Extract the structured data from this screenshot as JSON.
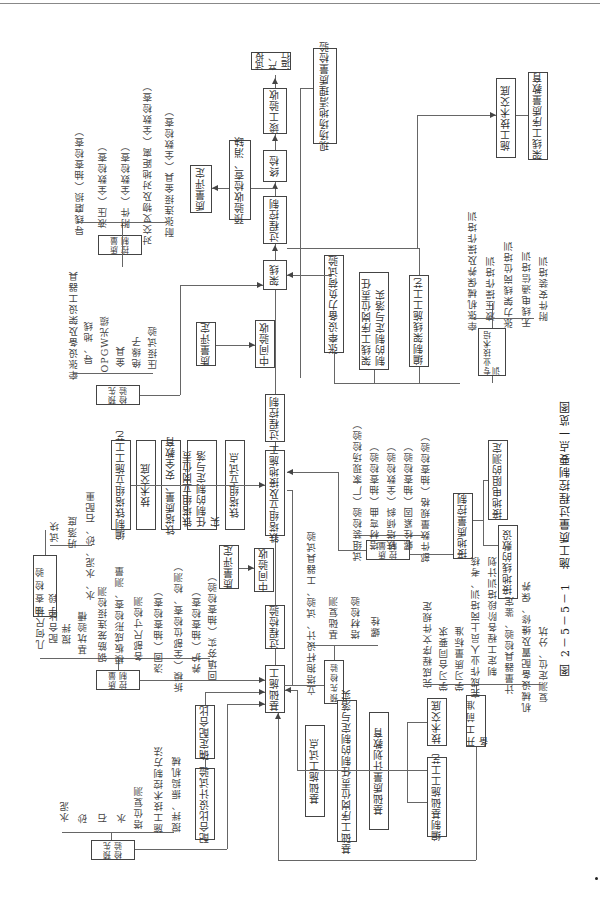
{
  "caption": "图 2－5－5－1　施工质量过程控制要点一览图",
  "main_flow": {
    "foundation": "基础施工",
    "process_inspection": "过程检验",
    "interim_acceptance_1": "中间验收",
    "tower_erection": "铁塔组立及接地施工",
    "process_control_1": "过程控制",
    "interim_acceptance_2": "中间验收",
    "stringing": "架线",
    "process_control_2": "过程控制",
    "final_inspection": "终检",
    "completion_acceptance": "竣工验收",
    "trial_operation": "试投产、运行"
  },
  "quality_rating": [
    "质量评定",
    "质量评定",
    "质量评定"
  ],
  "pre_acceptance": "预验收检查、消缺",
  "site_cleanup": "现场场地清理质量检验",
  "stringing_qc": {
    "title": "质量控制",
    "items": [
      "导线磨损（抽查检查）",
      "液压（全数检查）",
      "附件（全数检查）",
      "对交叉物及对地距离（全数检查）",
      "耐张连接金具（全数检查）"
    ]
  },
  "stringing_precheck": {
    "title": "预先检验",
    "items": [
      "牵张设备及架设工器具",
      "导、地线",
      "OPGW光缆",
      "金具",
      "绝缘子",
      "压接试验"
    ]
  },
  "stringing_prep": {
    "load_test": "张牵设备力负荷试验",
    "responsibility": "架线工序岗位责任制的制定与落实",
    "process": "编制架线施工工艺",
    "tech_briefing": "施工技术交底",
    "quality_education": "架线工序质量教育"
  },
  "training": {
    "title": "专业技术培训",
    "items": [
      "牵张机械保养及操作培训",
      "液压操作培训",
      "张力架线岗位培训",
      "无线电通信培训",
      "附件安装培训"
    ]
  },
  "tower_prep": [
    "编制铁塔组立施工工艺",
    "技术交底",
    "铁塔质量、安全教育",
    "铁塔组立岗位责任制的制定与落实",
    "铁塔组立试点"
  ],
  "tower_qc": {
    "title": "质量控制",
    "items": [
      "试组装检验（厂家现场检验）",
      "塔材弯曲（抽查检验）",
      "铁塔倾斜（全数检验）",
      "螺栓紧固（抽查检验）",
      "部件数量规格（抽查检验）"
    ]
  },
  "grounding": {
    "title": "接地质量控制",
    "items": [
      "接地电阻的测定",
      "接地线的敷设"
    ]
  },
  "tower_precheck": {
    "title": "预先检验",
    "items": [
      "立塔抱杆设计、试验、工器具试验",
      "基础复测",
      "塔材检验",
      "螺栓"
    ]
  },
  "sampling": {
    "title": "抽查检验手段",
    "items": [
      "试块",
      "坍落度",
      "水、水泥、砂、石配重"
    ]
  },
  "foundation_qc": {
    "title": "质量控制",
    "items": [
      "几何尺寸",
      "配合比",
      "搅拌",
      "基坑验槽",
      "钢筋笼连接检测",
      "模板成形检查、测量",
      "各部尺寸检测",
      "浇固（抽查检查）",
      "拆模（全部位检查、检测）",
      "养护（抽查检查）",
      "回填夯实（抽查检验）"
    ]
  },
  "mix": {
    "confirm": "确定配合比",
    "design_test": "配合比设计试验"
  },
  "foundation_precheck": {
    "title": "预先检验",
    "items": [
      "水泥",
      "砂",
      "石",
      "水",
      "塔位复测",
      "施工技术控制方法",
      "搅拌、振捣机械"
    ]
  },
  "foundation_prep": [
    "基础施工试点",
    "基础工序岗位责任制的制定与落实",
    "基础质量计划教育",
    "技术交底",
    "编制基础施工工艺"
  ],
  "pre_construction": {
    "title": "开工前准备",
    "items": [
      "完成程序文件规定",
      "学习合同要求",
      "学习质量标准",
      "完成作业人员上岗培训、考核",
      "制定工程各阶段培训计划",
      "计量器具检验、鉴定",
      "机械设备配置及维修、保养",
      "复测定位、分坑"
    ]
  }
}
